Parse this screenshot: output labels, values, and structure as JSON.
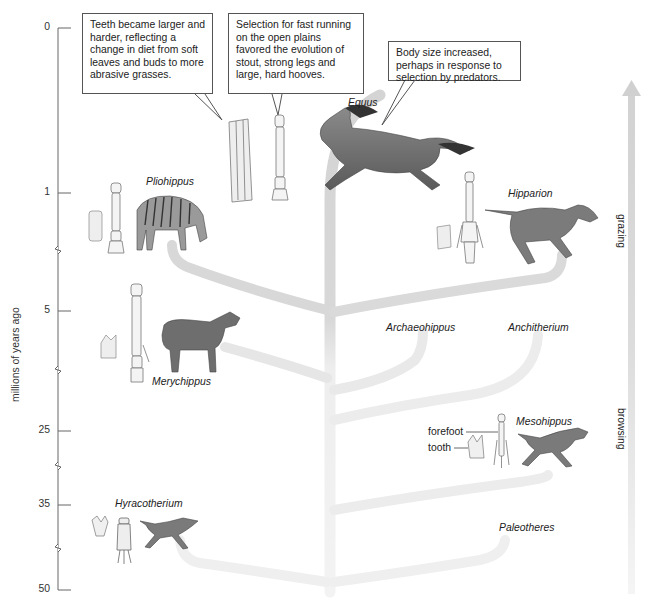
{
  "axis": {
    "title": "millions of years ago",
    "ticks": [
      {
        "label": "0",
        "y": 28
      },
      {
        "label": "1",
        "y": 193
      },
      {
        "label": "5",
        "y": 311
      },
      {
        "label": "25",
        "y": 431
      },
      {
        "label": "35",
        "y": 505
      },
      {
        "label": "50",
        "y": 590
      }
    ]
  },
  "callouts": {
    "teeth": "Teeth became larger and harder, reflecting a change in diet from soft leaves and buds to more abrasive grasses.",
    "legs": "Selection for fast running on the open plains favored the evolution of stout, strong legs and large, hard hooves.",
    "body": "Body size increased, perhaps in response to selection by predators."
  },
  "taxa": {
    "equus": "Equus",
    "pliohippus": "Pliohippus",
    "hipparion": "Hipparion",
    "merychippus": "Merychippus",
    "archaeohippus": "Archaeohippus",
    "anchitherium": "Anchitherium",
    "mesohippus": "Mesohippus",
    "hyracotherium": "Hyracotherium",
    "paleotheres": "Paleotheres"
  },
  "annotations": {
    "forefoot": "forefoot",
    "tooth": "tooth"
  },
  "diet_arrow": {
    "top": "grazing",
    "bottom": "browsing"
  },
  "colors": {
    "branch": "#d9d9d9",
    "branch_light": "#ececec",
    "axis": "#666666",
    "animal": "#6b6b6b",
    "bone": "#f2f2f2"
  }
}
